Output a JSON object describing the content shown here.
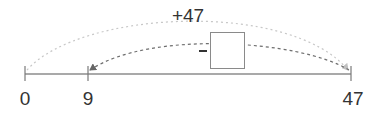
{
  "number_line": {
    "ticks": [
      {
        "value": "0",
        "x": 25
      },
      {
        "value": "9",
        "x": 88
      },
      {
        "value": "47",
        "x": 351
      }
    ]
  },
  "arcs": {
    "forward": {
      "label": "+47",
      "from": "0",
      "to": "47",
      "color": "#c8c8c8"
    },
    "backward": {
      "operator": "−",
      "from": "47",
      "to": "9",
      "color": "#6e6e6e",
      "blank": ""
    }
  },
  "colors": {
    "axis": "#8c8c8c",
    "text": "#333333"
  }
}
